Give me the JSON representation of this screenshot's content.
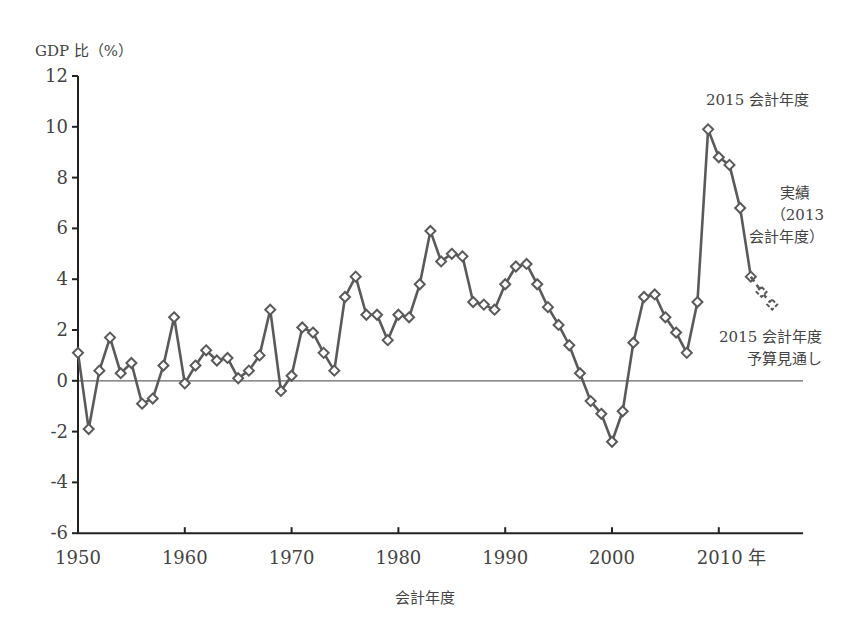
{
  "chart_data": {
    "type": "line",
    "title": "",
    "ylabel": "GDP 比（%）",
    "xlabel": "会計年度",
    "ylim": [
      -6,
      12
    ],
    "xlim": [
      1950,
      2016
    ],
    "yticks": [
      12,
      10,
      8,
      6,
      4,
      2,
      0,
      -2,
      -4,
      -6
    ],
    "xticks": [
      {
        "value": 1950,
        "label": "1950"
      },
      {
        "value": 1960,
        "label": "1960"
      },
      {
        "value": 1970,
        "label": "1970"
      },
      {
        "value": 1980,
        "label": "1980"
      },
      {
        "value": 1990,
        "label": "1990"
      },
      {
        "value": 2000,
        "label": "2000"
      },
      {
        "value": 2010,
        "label": "2010 年"
      }
    ],
    "grid": false,
    "zero_line": true,
    "marker": "diamond",
    "series": [
      {
        "name": "実績",
        "style": "solid",
        "x": [
          1950,
          1951,
          1952,
          1953,
          1954,
          1955,
          1956,
          1957,
          1958,
          1959,
          1960,
          1961,
          1962,
          1963,
          1964,
          1965,
          1966,
          1967,
          1968,
          1969,
          1970,
          1971,
          1972,
          1973,
          1974,
          1975,
          1976,
          1977,
          1978,
          1979,
          1980,
          1981,
          1982,
          1983,
          1984,
          1985,
          1986,
          1987,
          1988,
          1989,
          1990,
          1991,
          1992,
          1993,
          1994,
          1995,
          1996,
          1997,
          1998,
          1999,
          2000,
          2001,
          2002,
          2003,
          2004,
          2005,
          2006,
          2007,
          2008,
          2009,
          2010,
          2011,
          2012,
          2013
        ],
        "values": [
          1.1,
          -1.9,
          0.4,
          1.7,
          0.3,
          0.7,
          -0.9,
          -0.7,
          0.6,
          2.5,
          -0.1,
          0.6,
          1.2,
          0.8,
          0.9,
          0.1,
          0.4,
          1.0,
          2.8,
          -0.4,
          0.2,
          2.1,
          1.9,
          1.1,
          0.4,
          3.3,
          4.1,
          2.6,
          2.6,
          1.6,
          2.6,
          2.5,
          3.8,
          5.9,
          4.7,
          5.0,
          4.9,
          3.1,
          3.0,
          2.8,
          3.8,
          4.5,
          4.6,
          3.8,
          2.9,
          2.2,
          1.4,
          0.3,
          -0.8,
          -1.3,
          -2.4,
          -1.2,
          1.5,
          3.3,
          3.4,
          2.5,
          1.9,
          1.1,
          3.1,
          9.9,
          8.8,
          8.5,
          6.8,
          4.1
        ]
      },
      {
        "name": "2015 会計年度 予算見通し",
        "style": "dashed",
        "x": [
          2013,
          2014,
          2015
        ],
        "values": [
          4.1,
          3.5,
          3.0
        ]
      }
    ],
    "annotations": [
      {
        "text": "2015 会計年度",
        "x": 2009,
        "y": 10.7
      },
      {
        "text": "実績（2013 会計年度）",
        "x": 2015,
        "y": 7.0
      },
      {
        "text": "2015 会計年度 予算見通し",
        "x": 2015,
        "y": 1.5
      }
    ]
  },
  "labels": {
    "ylabel": "GDP 比（%）",
    "xlabel": "会計年度",
    "ann_peak": "2015 会計年度",
    "ann_actual_1": "実績",
    "ann_actual_2": "（2013",
    "ann_actual_3": "会計年度）",
    "ann_budget_1": "2015 会計年度",
    "ann_budget_2": "予算見通し"
  },
  "colors": {
    "line": "#5a5a5a",
    "axis": "#222222",
    "zero_line": "#666666",
    "marker_fill": "#ffffff",
    "text": "#444444"
  }
}
